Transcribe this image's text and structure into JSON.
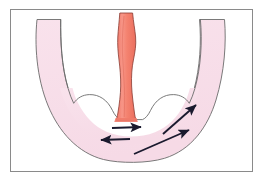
{
  "figure": {
    "title": "Anatomical flow diagram",
    "frame": {
      "x": 10,
      "y": 9,
      "width": 243,
      "height": 163,
      "border_color": "#8a8a8a",
      "background": "#ffffff"
    },
    "structures": [
      {
        "name": "u-shaped-organ",
        "label": "U-shaped tubular organ wall",
        "fill_color": "#f8dfe9",
        "stroke_color": "#6b6b6b",
        "outer_path": "M 36 20 C 34 42 36 74 48 104 C 58 130 76 152 102 159 C 118 163 146 163 163 158 C 190 150 207 126 215 100 C 224 72 226 42 224 20 L 200 20 C 201 40 200 66 194 88 C 187 112 174 130 155 137 C 140 143 122 143 108 137 C 89 129 76 111 69 88 C 62 66 61 40 61 20 Z",
        "inner_notch_left": "M 108 113 C 103 105 96 101 88 101 C 80 101 74 105 70 112",
        "inner_notch_right": "M 152 113 C 157 105 164 101 172 101 C 180 101 186 105 190 112"
      },
      {
        "name": "central-red-tube",
        "label": "Central tube (esophagus / neck)",
        "fill_color": "#f4806f",
        "stroke_color": "#8a3b32",
        "top_y": 13,
        "bottom_y": 120,
        "top_width": 13,
        "waist_width": 10,
        "bottom_width": 17
      }
    ],
    "arrows": [
      {
        "name": "arrow-right-short",
        "label": "short arrow pointing right",
        "x1": 112,
        "y1": 128,
        "x2": 141,
        "y2": 127,
        "color": "#1a1a2e"
      },
      {
        "name": "arrow-left-short",
        "label": "short arrow pointing left",
        "x1": 130,
        "y1": 139,
        "x2": 101,
        "y2": 140,
        "color": "#1a1a2e"
      },
      {
        "name": "arrow-diagonal-upper-right",
        "label": "long diagonal arrow pointing up-right",
        "x1": 163,
        "y1": 134,
        "x2": 196,
        "y2": 105,
        "color": "#1a1a2e"
      },
      {
        "name": "arrow-diagonal-lower-right",
        "label": "long diagonal arrow pointing up-right along lower wall",
        "x1": 134,
        "y1": 154,
        "x2": 189,
        "y2": 130,
        "color": "#1a1a2e"
      }
    ],
    "colors": {
      "organ_fill": "#f8dfe9",
      "organ_stroke": "#6b6b6b",
      "tube_fill": "#f4806f",
      "tube_stroke": "#8a3b32",
      "arrow": "#1a1a2e",
      "frame": "#8a8a8a",
      "background": "#ffffff"
    }
  }
}
